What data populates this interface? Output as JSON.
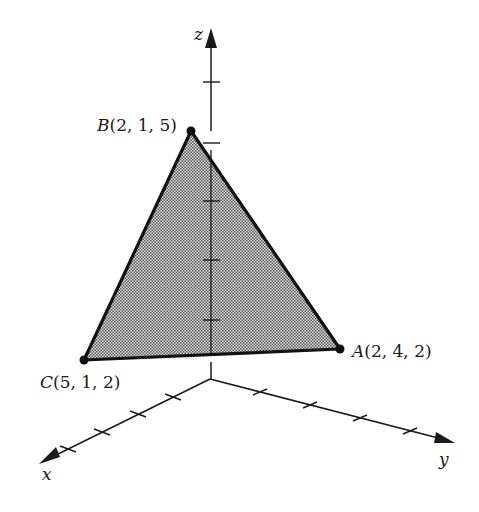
{
  "diagram": {
    "type": "3d-coordinate-triangle",
    "axes": {
      "x": {
        "label": "x"
      },
      "y": {
        "label": "y"
      },
      "z": {
        "label": "z"
      }
    },
    "points": {
      "A": {
        "name": "A",
        "coords": "(2, 4, 2)"
      },
      "B": {
        "name": "B",
        "coords": "(2, 1, 5)"
      },
      "C": {
        "name": "C",
        "coords": "(5, 1, 2)"
      }
    },
    "colors": {
      "stroke": "#1a1a1a",
      "fill_pattern": "#9a9a9a",
      "background": "#ffffff"
    }
  }
}
